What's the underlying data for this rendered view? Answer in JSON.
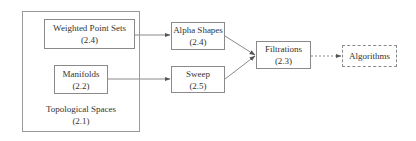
{
  "diagram": {
    "type": "flow",
    "group": {
      "label": "Topological Spaces",
      "ref": "(2.1)"
    },
    "nodes": [
      {
        "id": "weighted",
        "label": "Weighted Point Sets",
        "ref": "(2.4)",
        "style": "solid"
      },
      {
        "id": "manifolds",
        "label": "Manifolds",
        "ref": "(2.2)",
        "style": "solid"
      },
      {
        "id": "alpha",
        "label": "Alpha Shapes",
        "ref": "(2.4)",
        "style": "solid"
      },
      {
        "id": "sweep",
        "label": "Sweep",
        "ref": "(2.5)",
        "style": "solid"
      },
      {
        "id": "filtrations",
        "label": "Filtrations",
        "ref": "(2.3)",
        "style": "solid"
      },
      {
        "id": "algorithms",
        "label": "Algorithms",
        "ref": "",
        "style": "dashed"
      }
    ],
    "edges": [
      {
        "from": "weighted",
        "to": "alpha",
        "style": "solid"
      },
      {
        "from": "manifolds",
        "to": "sweep",
        "style": "solid"
      },
      {
        "from": "alpha",
        "to": "filtrations",
        "style": "solid"
      },
      {
        "from": "sweep",
        "to": "filtrations",
        "style": "solid"
      },
      {
        "from": "filtrations",
        "to": "algorithms",
        "style": "dashed"
      }
    ],
    "colors": {
      "line": "#8a8a8a",
      "text": "#333333",
      "background": "#ffffff"
    }
  }
}
